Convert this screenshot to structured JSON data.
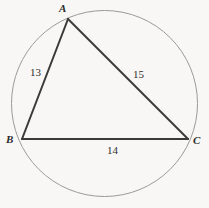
{
  "figure": {
    "kind": "triangle-inscribed-in-circle",
    "background_color": "#f8f7f5",
    "circle": {
      "name": "circumcircle",
      "center_x": 104.5,
      "center_y": 103.5,
      "radius": 93,
      "stroke_color": "#9a9a9a",
      "stroke_width": 1
    },
    "triangle": {
      "stroke_color": "#3a3a3a",
      "stroke_width": 2,
      "fill": "none",
      "vertices": [
        {
          "label": "A",
          "x": 68,
          "y": 19
        },
        {
          "label": "B",
          "x": 22,
          "y": 139
        },
        {
          "label": "C",
          "x": 188,
          "y": 139
        }
      ]
    },
    "vertex_labels": {
      "a": "A",
      "b": "B",
      "c": "C"
    },
    "side_labels": {
      "ab": "13",
      "ac": "15",
      "bc": "14"
    }
  },
  "chart_data": {
    "type": "diagram",
    "title": "",
    "shape": "triangle inscribed in a circle",
    "points": [
      {
        "name": "A",
        "x": 68,
        "y": 19
      },
      {
        "name": "B",
        "x": 22,
        "y": 139
      },
      {
        "name": "C",
        "x": 188,
        "y": 139
      }
    ],
    "edges": [
      {
        "from": "A",
        "to": "B",
        "length_label": "13"
      },
      {
        "from": "A",
        "to": "C",
        "length_label": "15"
      },
      {
        "from": "B",
        "to": "C",
        "length_label": "14"
      }
    ],
    "circle": {
      "cx": 104.5,
      "cy": 103.5,
      "r": 93
    }
  }
}
